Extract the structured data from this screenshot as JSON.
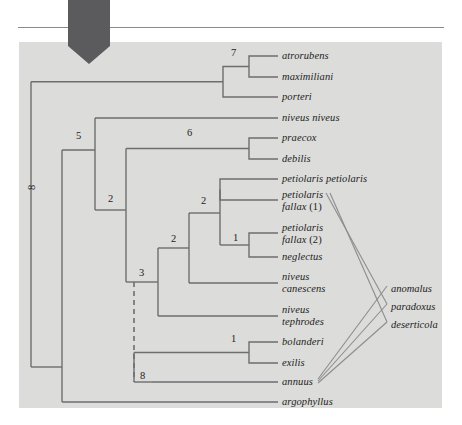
{
  "figure": {
    "panel_color": "#dcdcda",
    "line_color": "#6e6e70",
    "arrow_color": "#5b5b5d",
    "rule_color": "#8a8a8a",
    "text_color": "#1d1d1d"
  },
  "pointer": {
    "name": "down-arrow-annotation",
    "color": "#5b5b5d"
  },
  "taxa": [
    {
      "id": "atrorubens",
      "label": "atrorubens",
      "label2": "",
      "suffix": "",
      "x": 282,
      "y": 56
    },
    {
      "id": "maximiliani",
      "label": "maximiliani",
      "label2": "",
      "suffix": "",
      "x": 282,
      "y": 77
    },
    {
      "id": "porteri",
      "label": "porteri",
      "label2": "",
      "suffix": "",
      "x": 282,
      "y": 97
    },
    {
      "id": "niveus-niveus",
      "label": "niveus niveus",
      "label2": "",
      "suffix": "",
      "x": 282,
      "y": 118
    },
    {
      "id": "praecox",
      "label": "praecox",
      "label2": "",
      "suffix": "",
      "x": 282,
      "y": 138
    },
    {
      "id": "debilis",
      "label": "debilis",
      "label2": "",
      "suffix": "",
      "x": 282,
      "y": 159
    },
    {
      "id": "petiolaris-petiolaris",
      "label": "petiolaris petiolaris",
      "label2": "",
      "suffix": "",
      "x": 282,
      "y": 179
    },
    {
      "id": "petiolaris-fallax-1",
      "label": "petiolaris",
      "label2": "fallax",
      "suffix": " (1)",
      "x": 282,
      "y": 195
    },
    {
      "id": "petiolaris-fallax-2",
      "label": "petiolaris",
      "label2": "fallax",
      "suffix": " (2)",
      "x": 282,
      "y": 228
    },
    {
      "id": "neglectus",
      "label": "neglectus",
      "label2": "",
      "suffix": "",
      "x": 282,
      "y": 257
    },
    {
      "id": "niveus-canescens",
      "label": "niveus",
      "label2": "canescens",
      "suffix": "",
      "x": 282,
      "y": 277
    },
    {
      "id": "niveus-tephrodes",
      "label": "niveus",
      "label2": "tephrodes",
      "suffix": "",
      "x": 282,
      "y": 310
    },
    {
      "id": "bolanderi",
      "label": "bolanderi",
      "label2": "",
      "suffix": "",
      "x": 282,
      "y": 342
    },
    {
      "id": "exilis",
      "label": "exilis",
      "label2": "",
      "suffix": "",
      "x": 282,
      "y": 363
    },
    {
      "id": "annuus",
      "label": "annuus",
      "label2": "",
      "suffix": "",
      "x": 282,
      "y": 382
    },
    {
      "id": "argophyllus",
      "label": "argophyllus",
      "label2": "",
      "suffix": "",
      "x": 282,
      "y": 402
    }
  ],
  "node_labels": [
    {
      "id": "node-8-root",
      "text": "8",
      "x": 26,
      "y": 183,
      "rotated": true
    },
    {
      "id": "node-7",
      "text": "7",
      "x": 231,
      "y": 53,
      "rotated": false
    },
    {
      "id": "node-5",
      "text": "5",
      "x": 76,
      "y": 136,
      "rotated": false
    },
    {
      "id": "node-6",
      "text": "6",
      "x": 187,
      "y": 133,
      "rotated": false
    },
    {
      "id": "node-2-upper",
      "text": "2",
      "x": 108,
      "y": 199,
      "rotated": false
    },
    {
      "id": "node-2-mid",
      "text": "2",
      "x": 201,
      "y": 201,
      "rotated": false
    },
    {
      "id": "node-2-lower",
      "text": "2",
      "x": 171,
      "y": 239,
      "rotated": false
    },
    {
      "id": "node-1-fallax",
      "text": "1",
      "x": 233,
      "y": 238,
      "rotated": false
    },
    {
      "id": "node-3",
      "text": "3",
      "x": 139,
      "y": 273,
      "rotated": false
    },
    {
      "id": "node-1-bolanderi",
      "text": "1",
      "x": 231,
      "y": 339,
      "rotated": false
    },
    {
      "id": "node-8-annuus",
      "text": "8",
      "x": 140,
      "y": 375,
      "rotated": false
    }
  ],
  "hybrids": [
    {
      "id": "anomalus",
      "label": "anomalus",
      "x": 391,
      "y": 289
    },
    {
      "id": "paradoxus",
      "label": "paradoxus",
      "x": 391,
      "y": 307
    },
    {
      "id": "deserticola",
      "label": "deserticola",
      "x": 391,
      "y": 325
    }
  ],
  "hybrid_links": [
    {
      "from": "petiolaris-fallax-1",
      "to": "paradoxus"
    },
    {
      "from": "petiolaris-fallax-1",
      "to": "deserticola"
    },
    {
      "from": "annuus",
      "to": "anomalus"
    },
    {
      "from": "annuus",
      "to": "paradoxus"
    },
    {
      "from": "annuus",
      "to": "deserticola"
    }
  ]
}
